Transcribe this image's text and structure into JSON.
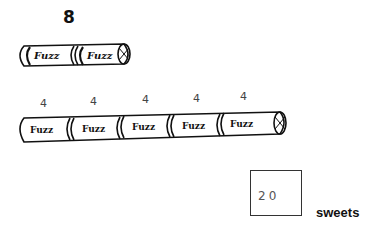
{
  "top_tube": {
    "count_label": "8",
    "sections": [
      "Fuzz",
      "Fuzz"
    ]
  },
  "bottom_tube": {
    "section_labels": [
      "4",
      "4",
      "4",
      "4",
      "4"
    ],
    "sections": [
      "Fuzz",
      "Fuzz",
      "Fuzz",
      "Fuzz",
      "Fuzz"
    ]
  },
  "answer": {
    "value": "20",
    "unit": "sweets"
  }
}
